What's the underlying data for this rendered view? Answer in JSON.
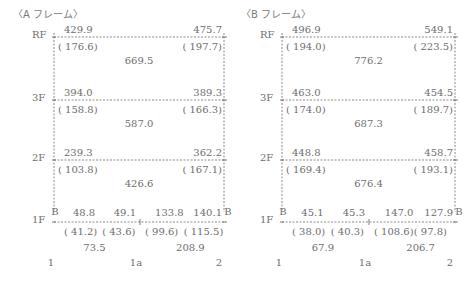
{
  "frames": [
    {
      "id": "A",
      "title": "〈A フレーム〉",
      "x_left": 54,
      "x_mid": 140,
      "x_right": 224,
      "floors": [
        {
          "label": "RF",
          "y": 37
        },
        {
          "label": "3F",
          "y": 100
        },
        {
          "label": "2F",
          "y": 160
        },
        {
          "label": "1F",
          "y": 222
        }
      ],
      "floor_values": [
        {
          "left": "429.9",
          "left_paren": "( 176.6)",
          "right": "475.7",
          "right_paren": "( 197.7)",
          "center": "669.5"
        },
        {
          "left": "394.0",
          "left_paren": "( 158.8)",
          "right": "389.3",
          "right_paren": "( 166.3)",
          "center": "587.0"
        },
        {
          "left": "239.3",
          "left_paren": "( 103.8)",
          "right": "362.2",
          "right_paren": "( 167.1)",
          "center": "426.6"
        }
      ],
      "base": {
        "support_left": "B",
        "support_right": "B",
        "top_values": [
          "48.8",
          "49.1",
          "133.8",
          "140.1"
        ],
        "paren_values": [
          "( 41.2)",
          "( 43.6)",
          "( 99.6)",
          "( 115.5)"
        ],
        "span_values": [
          "73.5",
          "208.9"
        ]
      },
      "axes": [
        "1",
        "1a",
        "2"
      ]
    },
    {
      "id": "B",
      "title": "〈B フレーム〉",
      "x_left": 282,
      "x_mid": 369,
      "x_right": 455,
      "floors": [
        {
          "label": "RF",
          "y": 37
        },
        {
          "label": "3F",
          "y": 100
        },
        {
          "label": "2F",
          "y": 160
        },
        {
          "label": "1F",
          "y": 222
        }
      ],
      "floor_values": [
        {
          "left": "496.9",
          "left_paren": "( 194.0)",
          "right": "549.1",
          "right_paren": "( 223.5)",
          "center": "776.2"
        },
        {
          "left": "463.0",
          "left_paren": "( 174.0)",
          "right": "454.5",
          "right_paren": "( 189.7)",
          "center": "687.3"
        },
        {
          "left": "448.8",
          "left_paren": "( 169.4)",
          "right": "458.7",
          "right_paren": "( 193.1)",
          "center": "676.4"
        }
      ],
      "base": {
        "support_left": "B",
        "support_right": "B",
        "top_values": [
          "45.1",
          "45.3",
          "147.0",
          "127.9"
        ],
        "paren_values": [
          "( 38.0)",
          "( 40.3)",
          "( 108.6)",
          "( 97.8)"
        ],
        "span_values": [
          "67.9",
          "206.7"
        ]
      },
      "axes": [
        "1",
        "1a",
        "2"
      ]
    }
  ]
}
